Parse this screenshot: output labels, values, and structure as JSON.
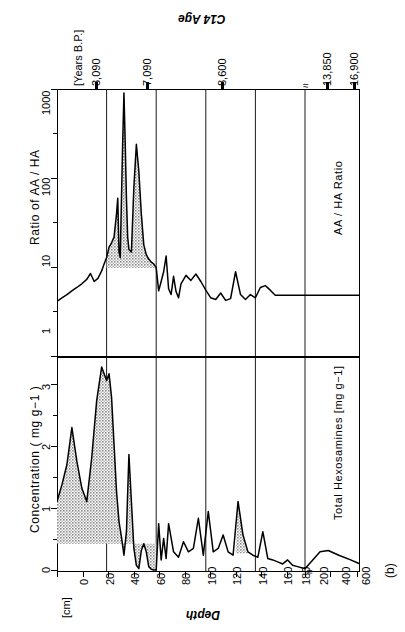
{
  "figure": {
    "panel_label": "(b)",
    "top_axis_title": "C14 Age",
    "top_axis_units": "[Years B.P.]",
    "bottom_axis_title": "Depth",
    "bottom_axis_units": "[cm]",
    "upper_axis_title": "Ratio of AA / HA",
    "lower_axis_title": "Concentration ( mg g−1 )",
    "upper_series_label": "AA / HA Ratio",
    "lower_series_label": "Total Hexosamines  [mg g−1]",
    "axis_break_symbol": "≈"
  },
  "chart_data": {
    "type": "line",
    "title": "C14 Age",
    "orientation": "rotated-90-depth-horizontal",
    "xlabel": "Depth",
    "xunits": "[cm]",
    "x_ticks": [
      0,
      20,
      40,
      60,
      80,
      100,
      120,
      140,
      160,
      180,
      200,
      400,
      600
    ],
    "x_axis_break_after": 200,
    "grid": true,
    "gridlines_at_depth": [
      40,
      80,
      120,
      160,
      200
    ],
    "c14_age": {
      "label": "C14 Age",
      "units": "[Years B.P.]",
      "ticks": [
        {
          "value": "3,090",
          "depth": 22
        },
        {
          "value": "7,090",
          "depth": 56
        },
        {
          "value": "8,600",
          "depth": 106
        },
        {
          "value": "13,850",
          "depth": 228
        },
        {
          "value": "16,900",
          "depth": 330
        }
      ]
    },
    "series": [
      {
        "name": "AA / HA Ratio",
        "panel": "upper",
        "ylabel": "Ratio of AA / HA",
        "yscale": "log",
        "ylim": [
          1,
          1000
        ],
        "y_ticks": [
          1,
          10,
          100,
          1000
        ],
        "shaded_depth_range": [
          40,
          80
        ],
        "shaded_baseline": 10,
        "x": [
          0,
          4,
          8,
          12,
          16,
          20,
          24,
          27,
          30,
          33,
          36,
          38,
          40,
          42,
          44,
          46,
          48,
          49,
          50,
          51,
          52,
          53,
          54,
          55,
          56,
          57,
          58,
          60,
          62,
          64,
          66,
          68,
          70,
          72,
          74,
          76,
          78,
          80,
          82,
          84,
          86,
          88,
          90,
          92,
          94,
          96,
          98,
          100,
          104,
          108,
          112,
          116,
          120,
          124,
          128,
          132,
          136,
          140,
          144,
          148,
          152,
          156,
          160,
          164,
          168,
          172,
          176,
          180,
          184,
          188,
          192,
          196,
          200,
          260,
          330,
          420,
          520,
          600
        ],
        "y": [
          4.2,
          4.6,
          5.0,
          5.5,
          6.0,
          6.6,
          7.4,
          8.6,
          7.0,
          7.6,
          9.2,
          11.0,
          13.0,
          17.0,
          19.0,
          22.0,
          40.0,
          60.0,
          15.0,
          13.0,
          60.0,
          260.0,
          900.0,
          250.0,
          60.0,
          22.0,
          16.0,
          15.0,
          80.0,
          240.0,
          120.0,
          40.0,
          18.0,
          14.0,
          12.5,
          11.5,
          11.0,
          10.0,
          5.5,
          7.0,
          9.0,
          13.5,
          5.8,
          5.0,
          8.0,
          5.4,
          4.6,
          6.6,
          8.2,
          7.2,
          8.5,
          7.0,
          5.6,
          4.6,
          4.4,
          5.2,
          4.3,
          4.5,
          9.0,
          5.0,
          4.4,
          5.0,
          4.6,
          6.0,
          6.3,
          5.6,
          4.9,
          4.9,
          4.9,
          4.9,
          4.9,
          4.9,
          4.9,
          4.9,
          4.9,
          4.9,
          4.9,
          4.9
        ]
      },
      {
        "name": "Total Hexosamines",
        "panel": "lower",
        "ylabel": "Concentration ( mg g−1 )",
        "yunits": "[mg g−1]",
        "yscale": "linear",
        "ylim": [
          0,
          3.2
        ],
        "y_ticks": [
          0,
          1,
          2,
          3
        ],
        "shaded_depth_range": [
          0,
          80
        ],
        "shaded_baseline": 0.42,
        "shaded_depth_range_2": [
          144,
          156
        ],
        "x": [
          0,
          4,
          8,
          12,
          16,
          20,
          24,
          28,
          32,
          36,
          40,
          42,
          44,
          46,
          48,
          50,
          52,
          54,
          56,
          58,
          60,
          62,
          64,
          66,
          68,
          70,
          72,
          74,
          76,
          78,
          80,
          82,
          84,
          86,
          88,
          90,
          94,
          98,
          102,
          106,
          110,
          114,
          118,
          122,
          126,
          130,
          134,
          138,
          142,
          146,
          150,
          154,
          158,
          162,
          166,
          170,
          174,
          178,
          182,
          186,
          190,
          194,
          198,
          200,
          260,
          330,
          420,
          520,
          600
        ],
        "y": [
          1.05,
          1.3,
          1.6,
          2.15,
          1.65,
          1.25,
          1.05,
          1.7,
          2.55,
          3.05,
          2.85,
          2.95,
          2.6,
          1.9,
          1.2,
          0.75,
          0.52,
          0.25,
          0.6,
          1.75,
          1.05,
          0.35,
          0.1,
          0.05,
          0.32,
          0.42,
          0.3,
          0.08,
          0.04,
          0.03,
          0.03,
          0.72,
          0.18,
          0.5,
          0.2,
          0.72,
          0.3,
          0.22,
          0.45,
          0.3,
          0.35,
          0.8,
          0.25,
          0.9,
          0.3,
          0.35,
          0.55,
          0.3,
          0.25,
          1.05,
          0.55,
          0.3,
          0.25,
          0.22,
          0.6,
          0.2,
          0.18,
          0.15,
          0.12,
          0.18,
          0.1,
          0.08,
          0.06,
          0.05,
          0.3,
          0.32,
          0.25,
          0.18,
          0.12
        ]
      }
    ]
  }
}
